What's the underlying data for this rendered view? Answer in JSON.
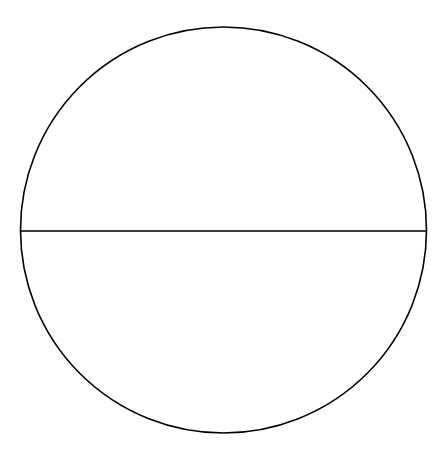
{
  "diagram": {
    "type": "geometry",
    "canvas": {
      "width": 441,
      "height": 456,
      "background": "#ffffff"
    },
    "circle": {
      "cx": 223.5,
      "cy": 230,
      "r": 203,
      "stroke": "#000000",
      "stroke_width": 1.6,
      "fill": "none"
    },
    "diameter": {
      "x1": 20.5,
      "y1": 231,
      "x2": 426.5,
      "y2": 231,
      "stroke": "#000000",
      "stroke_width": 1.6
    },
    "labels": []
  }
}
